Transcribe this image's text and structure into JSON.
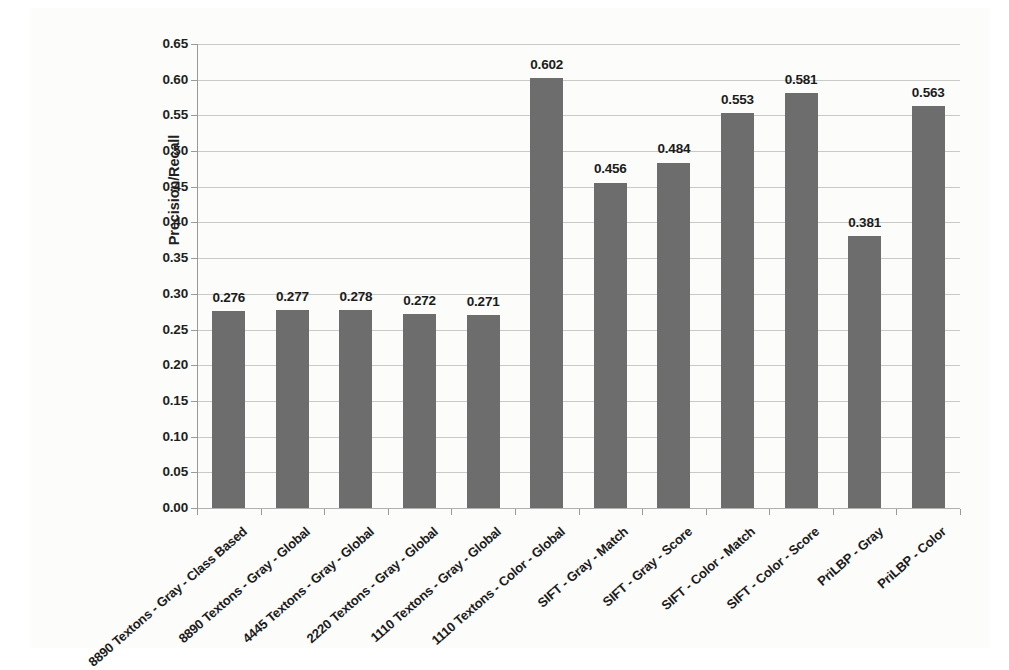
{
  "chart_data": {
    "type": "bar",
    "title": "",
    "xlabel": "",
    "ylabel": "Precision/Recall",
    "ylim": [
      0.0,
      0.65
    ],
    "ytick_step": 0.05,
    "grid": true,
    "legend": "none",
    "bar_color": "#6d6d6d",
    "gridline_color": "#c9c9c9",
    "categories": [
      "8890 Textons - Gray - Class Based",
      "8890 Textons - Gray - Global",
      "4445 Textons - Gray - Global",
      "2220 Textons - Gray - Global",
      "1110 Textons - Gray - Global",
      "1110 Textons - Color - Global",
      "SIFT - Gray - Match",
      "SIFT - Gray - Score",
      "SIFT - Color - Match",
      "SIFT - Color - Score",
      "PriLBP - Gray",
      "PriLBP - Color"
    ],
    "values": [
      0.276,
      0.277,
      0.278,
      0.272,
      0.271,
      0.602,
      0.456,
      0.484,
      0.553,
      0.581,
      0.381,
      0.563
    ],
    "value_labels": [
      "0.276",
      "0.277",
      "0.278",
      "0.272",
      "0.271",
      "0.602",
      "0.456",
      "0.484",
      "0.553",
      "0.581",
      "0.381",
      "0.563"
    ],
    "ytick_labels": [
      "0.00",
      "0.05",
      "0.10",
      "0.15",
      "0.20",
      "0.25",
      "0.30",
      "0.35",
      "0.40",
      "0.45",
      "0.50",
      "0.55",
      "0.60",
      "0.65"
    ],
    "ytick_values": [
      0.0,
      0.05,
      0.1,
      0.15,
      0.2,
      0.25,
      0.3,
      0.35,
      0.4,
      0.45,
      0.5,
      0.55,
      0.6,
      0.65
    ]
  }
}
